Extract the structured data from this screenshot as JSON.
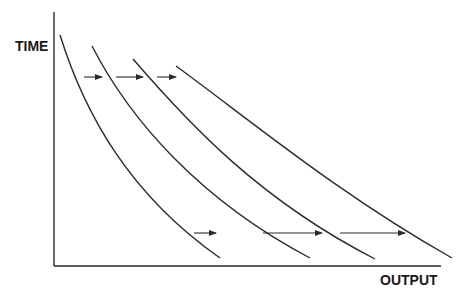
{
  "diagram": {
    "y_axis_label": "TIME",
    "x_axis_label": "OUTPUT",
    "colors": {
      "line": "#2a2a2a",
      "background": "#ffffff"
    },
    "axes": {
      "origin": [
        54,
        266
      ],
      "y_top": 12,
      "x_right": 441
    },
    "curves": [
      {
        "name": "curve-1",
        "path": "M60,35 C85,115 130,195 220,258"
      },
      {
        "name": "curve-2",
        "path": "M92,46 C130,120 200,200 310,258"
      },
      {
        "name": "curve-3",
        "path": "M133,59 C190,125 260,200 375,259"
      },
      {
        "name": "curve-4",
        "path": "M176,66 C250,120 340,195 452,258"
      }
    ],
    "arrows": [
      {
        "name": "top-arrow-1",
        "x1": 84,
        "x2": 102,
        "y": 77
      },
      {
        "name": "top-arrow-2",
        "x1": 116,
        "x2": 143,
        "y": 77
      },
      {
        "name": "top-arrow-3",
        "x1": 157,
        "x2": 176,
        "y": 77
      },
      {
        "name": "bottom-arrow-1",
        "x1": 194,
        "x2": 216,
        "y": 233
      },
      {
        "name": "bottom-arrow-2",
        "x1": 263,
        "x2": 322,
        "y": 233
      },
      {
        "name": "bottom-arrow-3",
        "x1": 340,
        "x2": 405,
        "y": 233
      }
    ]
  }
}
